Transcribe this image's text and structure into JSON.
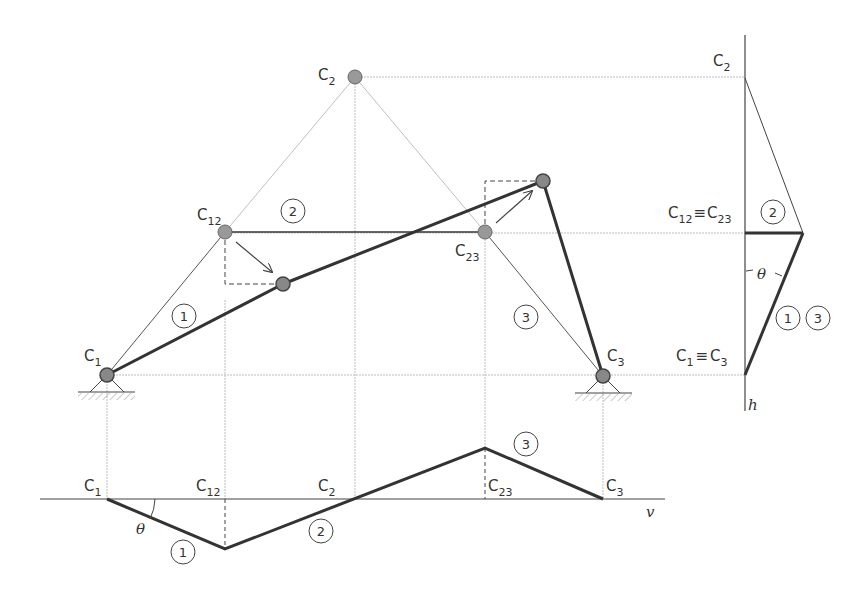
{
  "diagram": {
    "type": "mechanism-velocity-diagram",
    "colors": {
      "thick_line": "#333333",
      "thin_line": "#555555",
      "construction_line": "#bbbbbb",
      "node_fill": "#999999",
      "node_stroke": "#666666",
      "hatch": "#aaaaaa"
    },
    "mechanism": {
      "labels": {
        "c1": {
          "main": "C",
          "sub": "1"
        },
        "c2": {
          "main": "C",
          "sub": "2"
        },
        "c12": {
          "main": "C",
          "sub": "12"
        },
        "c23": {
          "main": "C",
          "sub": "23"
        },
        "c3": {
          "main": "C",
          "sub": "3"
        }
      },
      "link_numbers": [
        "1",
        "2",
        "3"
      ]
    },
    "horizontal_projection": {
      "axis_label": "v",
      "angle_label": "θ",
      "labels": {
        "c1": {
          "main": "C",
          "sub": "1"
        },
        "c12": {
          "main": "C",
          "sub": "12"
        },
        "c2": {
          "main": "C",
          "sub": "2"
        },
        "c23": {
          "main": "C",
          "sub": "23"
        },
        "c3": {
          "main": "C",
          "sub": "3"
        }
      },
      "link_numbers": [
        "1",
        "2",
        "3"
      ]
    },
    "vertical_projection": {
      "axis_label": "h",
      "angle_label": "θ",
      "labels": {
        "c2": {
          "main": "C",
          "sub": "2"
        },
        "c12_c23": {
          "left_main": "C",
          "left_sub": "12",
          "equiv": "≡",
          "right_main": "C",
          "right_sub": "23"
        },
        "c1_c3": {
          "left_main": "C",
          "left_sub": "1",
          "equiv": "≡",
          "right_main": "C",
          "right_sub": "3"
        }
      },
      "link_numbers": [
        "2",
        "1",
        "3"
      ]
    }
  }
}
